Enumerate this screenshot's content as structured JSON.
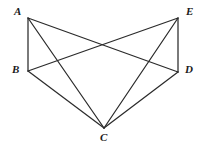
{
  "figure": {
    "background_color": "#ffffff",
    "line_color": "#2b2b2b",
    "label_color": "#1a1a1a",
    "width": 201,
    "height": 147
  },
  "vertices": [
    {
      "id": "A",
      "label": "A",
      "x": 28,
      "y": 18,
      "label_x": 14,
      "label_y": 6
    },
    {
      "id": "B",
      "label": "B",
      "x": 28,
      "y": 71,
      "label_x": 12,
      "label_y": 64
    },
    {
      "id": "C",
      "label": "C",
      "x": 104,
      "y": 128,
      "label_x": 100,
      "label_y": 132
    },
    {
      "id": "D",
      "label": "D",
      "x": 178,
      "y": 72,
      "label_x": 185,
      "label_y": 64
    },
    {
      "id": "E",
      "label": "E",
      "x": 178,
      "y": 18,
      "label_x": 186,
      "label_y": 6
    }
  ],
  "edges": [
    {
      "id": "AB",
      "from": "A",
      "to": "B",
      "name": "segment-ab"
    },
    {
      "id": "AC",
      "from": "A",
      "to": "C",
      "name": "segment-ac"
    },
    {
      "id": "AD",
      "from": "A",
      "to": "D",
      "name": "segment-ad"
    },
    {
      "id": "BC",
      "from": "B",
      "to": "C",
      "name": "segment-bc"
    },
    {
      "id": "BE",
      "from": "B",
      "to": "E",
      "name": "segment-be"
    },
    {
      "id": "CD",
      "from": "C",
      "to": "D",
      "name": "segment-cd"
    },
    {
      "id": "CE",
      "from": "C",
      "to": "E",
      "name": "segment-ce"
    },
    {
      "id": "DE",
      "from": "D",
      "to": "E",
      "name": "segment-de"
    }
  ]
}
